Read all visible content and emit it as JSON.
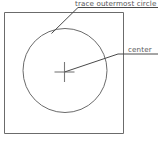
{
  "diagram": {
    "background_color": "#ffffff",
    "line_color": "#6b6b6b",
    "text_color": "#58585a",
    "shapes": {
      "square": {
        "name": "outer-square",
        "x": 4.5,
        "y": 12.5,
        "width": 119,
        "height": 121
      },
      "circle": {
        "name": "outermost-circle",
        "cx": 65,
        "cy": 70.5,
        "r": 42
      },
      "crosshair": {
        "name": "center-crosshair",
        "cx": 64.5,
        "cy": 72,
        "horizontal_half_length": 10,
        "vertical_half_length": 10
      }
    },
    "annotations": [
      {
        "id": "trace-outermost-circle",
        "text": "trace outermost circle",
        "text_x": 75,
        "text_y": 8.5,
        "leader": "M 51.5,33.5 L 78,7.5 L 158,7.5"
      },
      {
        "id": "center",
        "text": "center",
        "text_x": 128,
        "text_y": 53,
        "leader": "M 64.5,72 L 118,54 L 158,54"
      }
    ]
  }
}
